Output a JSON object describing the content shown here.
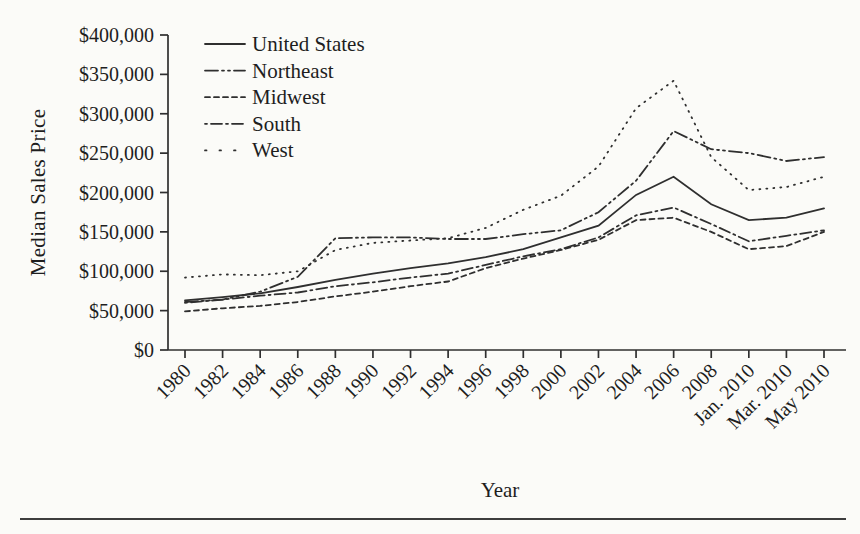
{
  "page": {
    "background": "#fbfbf8",
    "ink": "#2f2f2f"
  },
  "chart_data": {
    "type": "line",
    "title": "",
    "xlabel": "Year",
    "ylabel": "Median Sales Price",
    "ylim": [
      0,
      400000
    ],
    "ytick_step": 50000,
    "ytick_labels": [
      "$0",
      "$50,000",
      "$100,000",
      "$150,000",
      "$200,000",
      "$250,000",
      "$300,000",
      "$350,000",
      "$400,000"
    ],
    "categories": [
      "1980",
      "1982",
      "1984",
      "1986",
      "1988",
      "1990",
      "1992",
      "1994",
      "1996",
      "1998",
      "2000",
      "2002",
      "2004",
      "2006",
      "2008",
      "Jan. 2010",
      "Mar. 2010",
      "May 2010"
    ],
    "grid": false,
    "legend_position": "top-left",
    "series": [
      {
        "name": "United States",
        "dash": "solid",
        "values": [
          63000,
          67000,
          72000,
          80000,
          89000,
          97000,
          104000,
          110000,
          118000,
          128000,
          143000,
          158000,
          197000,
          220000,
          185000,
          165000,
          168000,
          180000
        ]
      },
      {
        "name": "Northeast",
        "dash": "dash-dot-dot",
        "values": [
          61000,
          64000,
          74000,
          93000,
          142000,
          143000,
          143000,
          141000,
          141000,
          147000,
          152000,
          175000,
          215000,
          278000,
          255000,
          250000,
          240000,
          245000
        ]
      },
      {
        "name": "Midwest",
        "dash": "short-dash",
        "values": [
          49000,
          53000,
          56000,
          61000,
          68000,
          74000,
          81000,
          87000,
          104000,
          116000,
          127000,
          140000,
          165000,
          168000,
          150000,
          128000,
          132000,
          150000
        ]
      },
      {
        "name": "South",
        "dash": "dot-dash",
        "values": [
          60000,
          64000,
          69000,
          73000,
          81000,
          86000,
          92000,
          97000,
          108000,
          119000,
          128000,
          143000,
          171000,
          181000,
          160000,
          138000,
          145000,
          152000
        ]
      },
      {
        "name": "West",
        "dash": "dotted",
        "values": [
          92000,
          96000,
          95000,
          100000,
          127000,
          136000,
          139000,
          142000,
          155000,
          178000,
          196000,
          233000,
          307000,
          342000,
          245000,
          203000,
          207000,
          220000
        ]
      }
    ]
  }
}
